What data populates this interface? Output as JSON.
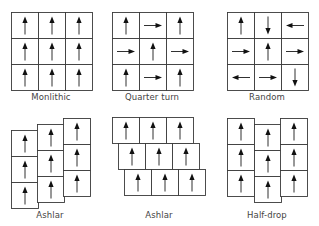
{
  "cell": {
    "width": 27,
    "height": 26
  },
  "colors": {
    "stroke": "#3a3a3a",
    "arrow": "#111111",
    "label": "#444444",
    "background": "#ffffff"
  },
  "patterns": [
    {
      "id": "monolithic",
      "label": "Monlithic",
      "label_pos": {
        "x": 1,
        "y": 92
      },
      "tiles": [
        {
          "x": 11,
          "y": 12,
          "dir": "up"
        },
        {
          "x": 38,
          "y": 12,
          "dir": "up"
        },
        {
          "x": 65,
          "y": 12,
          "dir": "up"
        },
        {
          "x": 11,
          "y": 38,
          "dir": "up"
        },
        {
          "x": 38,
          "y": 38,
          "dir": "up"
        },
        {
          "x": 65,
          "y": 38,
          "dir": "up"
        },
        {
          "x": 11,
          "y": 64,
          "dir": "up"
        },
        {
          "x": 38,
          "y": 64,
          "dir": "up"
        },
        {
          "x": 65,
          "y": 64,
          "dir": "up"
        }
      ]
    },
    {
      "id": "quarter-turn",
      "label": "Quarter turn",
      "label_pos": {
        "x": 102,
        "y": 92
      },
      "tiles": [
        {
          "x": 112,
          "y": 12,
          "dir": "up"
        },
        {
          "x": 139,
          "y": 12,
          "dir": "right"
        },
        {
          "x": 166,
          "y": 12,
          "dir": "up"
        },
        {
          "x": 112,
          "y": 38,
          "dir": "right"
        },
        {
          "x": 139,
          "y": 38,
          "dir": "up"
        },
        {
          "x": 166,
          "y": 38,
          "dir": "right"
        },
        {
          "x": 112,
          "y": 64,
          "dir": "up"
        },
        {
          "x": 139,
          "y": 64,
          "dir": "right"
        },
        {
          "x": 166,
          "y": 64,
          "dir": "up"
        }
      ]
    },
    {
      "id": "random",
      "label": "Random",
      "label_pos": {
        "x": 217,
        "y": 92
      },
      "tiles": [
        {
          "x": 227,
          "y": 12,
          "dir": "up"
        },
        {
          "x": 254,
          "y": 12,
          "dir": "down"
        },
        {
          "x": 281,
          "y": 12,
          "dir": "left"
        },
        {
          "x": 227,
          "y": 38,
          "dir": "right"
        },
        {
          "x": 254,
          "y": 38,
          "dir": "up"
        },
        {
          "x": 281,
          "y": 38,
          "dir": "right"
        },
        {
          "x": 227,
          "y": 64,
          "dir": "left"
        },
        {
          "x": 254,
          "y": 64,
          "dir": "right"
        },
        {
          "x": 281,
          "y": 64,
          "dir": "down"
        }
      ]
    },
    {
      "id": "ashlar-vertical",
      "label": "Ashlar",
      "label_pos": {
        "x": 0,
        "y": 210
      },
      "tiles": [
        {
          "x": 11,
          "y": 130,
          "dir": "up"
        },
        {
          "x": 11,
          "y": 156,
          "dir": "up"
        },
        {
          "x": 11,
          "y": 182,
          "dir": "up"
        },
        {
          "x": 37,
          "y": 124,
          "dir": "up"
        },
        {
          "x": 37,
          "y": 150,
          "dir": "up"
        },
        {
          "x": 37,
          "y": 176,
          "dir": "up"
        },
        {
          "x": 63,
          "y": 118,
          "dir": "up"
        },
        {
          "x": 63,
          "y": 144,
          "dir": "up"
        },
        {
          "x": 63,
          "y": 170,
          "dir": "up"
        }
      ]
    },
    {
      "id": "ashlar-horizontal",
      "label": "Ashlar",
      "label_pos": {
        "x": 109,
        "y": 210
      },
      "tiles": [
        {
          "x": 112,
          "y": 117,
          "dir": "up"
        },
        {
          "x": 139,
          "y": 117,
          "dir": "up"
        },
        {
          "x": 166,
          "y": 117,
          "dir": "up"
        },
        {
          "x": 118,
          "y": 143,
          "dir": "up"
        },
        {
          "x": 145,
          "y": 143,
          "dir": "up"
        },
        {
          "x": 172,
          "y": 143,
          "dir": "up"
        },
        {
          "x": 124,
          "y": 169,
          "dir": "up"
        },
        {
          "x": 151,
          "y": 169,
          "dir": "up"
        },
        {
          "x": 178,
          "y": 169,
          "dir": "up"
        }
      ]
    },
    {
      "id": "half-drop",
      "label": "Half-drop",
      "label_pos": {
        "x": 217,
        "y": 210
      },
      "tiles": [
        {
          "x": 227,
          "y": 118,
          "dir": "up"
        },
        {
          "x": 227,
          "y": 144,
          "dir": "up"
        },
        {
          "x": 227,
          "y": 170,
          "dir": "up"
        },
        {
          "x": 254,
          "y": 124,
          "dir": "up"
        },
        {
          "x": 254,
          "y": 150,
          "dir": "up"
        },
        {
          "x": 254,
          "y": 176,
          "dir": "up"
        },
        {
          "x": 280,
          "y": 118,
          "dir": "up"
        },
        {
          "x": 280,
          "y": 144,
          "dir": "up"
        },
        {
          "x": 280,
          "y": 170,
          "dir": "up"
        }
      ]
    }
  ]
}
